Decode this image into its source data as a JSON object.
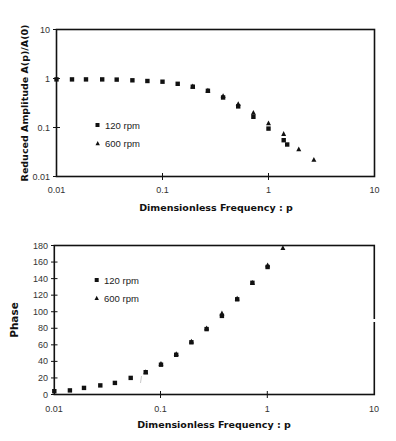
{
  "chart_data": [
    {
      "type": "scatter",
      "title": "",
      "xlabel": "Dimensionless Frequency : p",
      "ylabel": "Reduced Amplitude A(p)/A(0)",
      "xscale": "log",
      "yscale": "log",
      "xlim": [
        0.01,
        10
      ],
      "ylim": [
        0.01,
        10
      ],
      "x_ticks": [
        "0.01",
        "0.1",
        "1",
        "10"
      ],
      "y_ticks": [
        "0.01",
        "0.1",
        "1",
        "10"
      ],
      "grid": false,
      "legend_position": "inside-left-lower",
      "legend": [
        "120 rpm",
        "600 rpm"
      ],
      "series": [
        {
          "name": "120 rpm",
          "marker": "square",
          "x": [
            0.01,
            0.014,
            0.019,
            0.027,
            0.037,
            0.052,
            0.072,
            0.1,
            0.139,
            0.193,
            0.268,
            0.373,
            0.518,
            0.72,
            1.0,
            1.39,
            1.5
          ],
          "y": [
            0.96,
            0.96,
            0.96,
            0.96,
            0.95,
            0.92,
            0.89,
            0.86,
            0.78,
            0.68,
            0.56,
            0.41,
            0.27,
            0.165,
            0.095,
            0.055,
            0.045
          ]
        },
        {
          "name": "600 rpm",
          "marker": "triangle",
          "x": [
            0.193,
            0.268,
            0.373,
            0.518,
            0.72,
            1.0,
            1.39,
            1.93,
            2.68
          ],
          "y": [
            0.69,
            0.57,
            0.44,
            0.3,
            0.2,
            0.122,
            0.074,
            0.036,
            0.022
          ]
        }
      ]
    },
    {
      "type": "scatter",
      "title": "",
      "xlabel": "Dimensionless Frequency : p",
      "ylabel": "Phase",
      "xscale": "log",
      "yscale": "linear",
      "xlim": [
        0.01,
        10
      ],
      "ylim": [
        0,
        180
      ],
      "x_ticks": [
        "0.01",
        "0.1",
        "1",
        "10"
      ],
      "y_ticks": [
        "0",
        "20",
        "40",
        "60",
        "80",
        "100",
        "120",
        "140",
        "160",
        "180"
      ],
      "grid": false,
      "legend_position": "inside-left-upper",
      "legend": [
        "120 rpm",
        "600 rpm"
      ],
      "series": [
        {
          "name": "120 rpm",
          "marker": "square",
          "x": [
            0.01,
            0.014,
            0.019,
            0.027,
            0.037,
            0.052,
            0.072,
            0.1,
            0.139,
            0.193,
            0.268,
            0.373,
            0.518,
            0.72,
            1.0
          ],
          "y": [
            4,
            5,
            8,
            11,
            14,
            20,
            27,
            36,
            48,
            63,
            79,
            95,
            115,
            135,
            154
          ]
        },
        {
          "name": "600 rpm",
          "marker": "triangle",
          "x": [
            0.072,
            0.1,
            0.139,
            0.193,
            0.268,
            0.373,
            0.518,
            0.72,
            1.0,
            1.39
          ],
          "y": [
            27,
            37,
            49,
            64,
            80,
            98,
            116,
            135,
            156,
            177
          ]
        }
      ]
    }
  ],
  "amplitude_chart": {
    "ylabel": "Reduced Amplitude A(p)/A(0)",
    "xlabel": "Dimensionless Frequency : p",
    "y_ticks": [
      "10",
      "1",
      "0.1",
      "0.01"
    ],
    "x_ticks": [
      "0.01",
      "0.1",
      "1",
      "10"
    ],
    "legend": {
      "series1": "120 rpm",
      "series2": "600 rpm"
    }
  },
  "phase_chart": {
    "ylabel": "Phase",
    "xlabel": "Dimensionless Frequency : p",
    "y_ticks": [
      "180",
      "160",
      "140",
      "120",
      "100",
      "80",
      "60",
      "40",
      "20",
      "0"
    ],
    "x_ticks": [
      "0.01",
      "0.1",
      "1",
      "10"
    ],
    "legend": {
      "series1": "120 rpm",
      "series2": "600 rpm"
    }
  },
  "colors": {
    "marker": "#111111",
    "frame": "#111111",
    "text": "#222222",
    "background": "#ffffff"
  }
}
